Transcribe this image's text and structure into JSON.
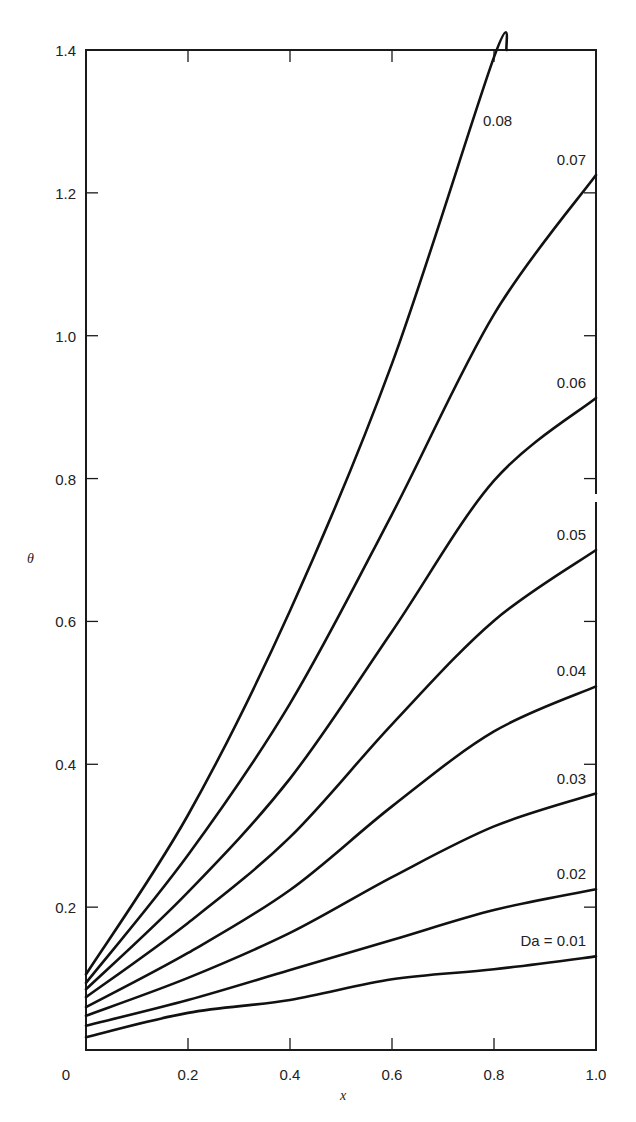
{
  "chart_data": {
    "type": "line",
    "title": "",
    "xlabel": "x",
    "ylabel": "θ",
    "xlim": [
      0,
      1.0
    ],
    "ylim": [
      0,
      1.4
    ],
    "grid": false,
    "legend": "inline labels at right end of curves",
    "x_ticks": [
      "0",
      "0.2",
      "0.4",
      "0.6",
      "0.8",
      "1.0"
    ],
    "y_ticks": [
      "0.2",
      "0.4",
      "0.6",
      "0.8",
      "1.0",
      "1.2",
      "1.4"
    ],
    "x": [
      0,
      0.2,
      0.4,
      0.6,
      0.8,
      1.0
    ],
    "series": [
      {
        "name": "Da = 0.01",
        "label": "Da = 0.01",
        "values": [
          0.018,
          0.052,
          0.07,
          0.099,
          0.113,
          0.131
        ]
      },
      {
        "name": "0.02",
        "label": "0.02",
        "values": [
          0.034,
          0.07,
          0.112,
          0.154,
          0.196,
          0.225
        ]
      },
      {
        "name": "0.03",
        "label": "0.03",
        "values": [
          0.048,
          0.101,
          0.164,
          0.242,
          0.313,
          0.359
        ]
      },
      {
        "name": "0.04",
        "label": "0.04",
        "values": [
          0.06,
          0.136,
          0.224,
          0.341,
          0.446,
          0.509
        ]
      },
      {
        "name": "0.05",
        "label": "0.05",
        "values": [
          0.074,
          0.178,
          0.298,
          0.456,
          0.601,
          0.7
        ]
      },
      {
        "name": "0.06",
        "label": "0.06",
        "values": [
          0.085,
          0.221,
          0.38,
          0.586,
          0.797,
          0.913
        ]
      },
      {
        "name": "0.07",
        "label": "0.07",
        "values": [
          0.094,
          0.273,
          0.485,
          0.75,
          1.03,
          1.225
        ]
      },
      {
        "name": "0.08",
        "label": "0.08",
        "values": [
          0.106,
          0.329,
          0.615,
          0.961,
          1.39,
          null
        ],
        "exits_top_at_x": 0.825
      }
    ]
  }
}
